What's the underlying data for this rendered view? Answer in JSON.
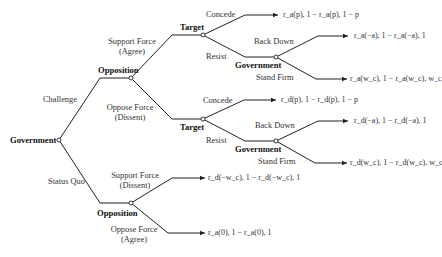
{
  "players": {
    "root": "Government",
    "opposition_top": "Opposition",
    "target_top": "Target",
    "government_top": "Government",
    "target_mid": "Target",
    "government_mid": "Government",
    "opposition_bottom": "Opposition"
  },
  "actions": {
    "challenge": "Challenge",
    "status_quo": "Status Quo",
    "support_force_agree_l1": "Support Force",
    "support_force_agree_l2": "(Agree)",
    "oppose_force_dissent_l1": "Oppose Force",
    "oppose_force_dissent_l2": "(Dissent)",
    "concede_top": "Concede",
    "resist_top": "Resist",
    "back_down_top": "Back Down",
    "stand_firm_top": "Stand Firm",
    "concede_mid": "Concede",
    "resist_mid": "Resist",
    "back_down_mid": "Back Down",
    "stand_firm_mid": "Stand Firm",
    "support_force_dissent_l1": "Support Force",
    "support_force_dissent_l2": "(Dissent)",
    "oppose_force_agree_l1": "Oppose Force",
    "oppose_force_agree_l2": "(Agree)"
  },
  "payoffs": {
    "p1": "r_a(p), 1 − r_a(p), 1 − p",
    "p2": "r_a(−a), 1 − r_a(−a), 1",
    "p3": "r_a(w_c), 1 − r_a(w_c), w_c",
    "p4": "r_d(p), 1 − r_d(p), 1 − p",
    "p5": "r_d(−a), 1 − r_d(−a), 1",
    "p6": "r_d(w_c), 1 − r_d(w_c), w_c",
    "p7": "r_d(−w_c), 1 − r_d(−w_c), 1",
    "p8": "r_a(0), 1 − r_a(0), 1"
  }
}
